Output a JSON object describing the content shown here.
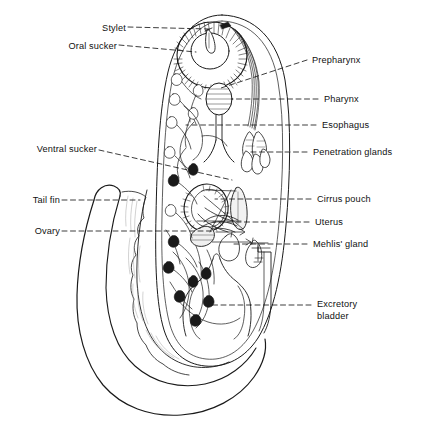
{
  "figure": {
    "background_color": "#ffffff",
    "line_color": "#1a1a1a",
    "leader_style": "dashed",
    "width": 422,
    "height": 425
  },
  "labels": {
    "left": [
      {
        "id": "stylet",
        "text": "Stylet",
        "x": 93,
        "y": 23,
        "leader_to_x": 207,
        "leader_to_y": 29,
        "slope": "down"
      },
      {
        "id": "oral_sucker",
        "text": "Oral sucker",
        "x": 55,
        "y": 41,
        "leader_to_x": 196,
        "leader_to_y": 50,
        "slope": "down"
      },
      {
        "id": "ventral_sucker",
        "text": "Ventral sucker",
        "x": 14,
        "y": 144,
        "leader_to_x": 224,
        "leader_to_y": 180,
        "slope": "down"
      },
      {
        "id": "tail_fin",
        "text": "Tail fin",
        "x": 26,
        "y": 196,
        "leader_to_x": 120,
        "leader_to_y": 200,
        "slope": "flat"
      },
      {
        "id": "ovary",
        "text": "Ovary",
        "x": 30,
        "y": 226,
        "leader_to_x": 200,
        "leader_to_y": 231,
        "slope": "flat"
      }
    ],
    "right": [
      {
        "id": "prepharynx",
        "text": "Prepharynx",
        "x": 312,
        "y": 56,
        "leader_to_x": 218,
        "leader_to_y": 84,
        "slope": "down"
      },
      {
        "id": "pharynx",
        "text": "Pharynx",
        "x": 325,
        "y": 95,
        "leader_to_x": 244,
        "leader_to_y": 98,
        "slope": "flat"
      },
      {
        "id": "esophagus",
        "text": "Esophagus",
        "x": 323,
        "y": 121,
        "leader_to_x": 215,
        "leader_to_y": 124,
        "slope": "flat"
      },
      {
        "id": "penetration_glands",
        "text": "Penetration glands",
        "x": 314,
        "y": 148,
        "leader_to_x": 248,
        "leader_to_y": 151,
        "slope": "flat"
      },
      {
        "id": "cirrus_pouch",
        "text": "Cirrus pouch",
        "x": 318,
        "y": 195,
        "leader_to_x": 215,
        "leader_to_y": 198,
        "slope": "flat"
      },
      {
        "id": "uterus",
        "text": "Uterus",
        "x": 316,
        "y": 218,
        "leader_to_x": 213,
        "leader_to_y": 221,
        "slope": "flat"
      },
      {
        "id": "mehlis_gland",
        "text": "Mehlis' gland",
        "x": 314,
        "y": 240,
        "leader_to_x": 230,
        "leader_to_y": 243,
        "slope": "flat"
      },
      {
        "id": "excretory_bladder",
        "text": "Excretory",
        "text2": "bladder",
        "x": 318,
        "y": 300,
        "leader_to_x": 213,
        "leader_to_y": 305,
        "slope": "flat"
      }
    ]
  },
  "anatomy": {
    "parts": [
      "body-outline",
      "oral-sucker",
      "stylet",
      "prepharynx",
      "pharynx",
      "esophagus",
      "penetration-glands",
      "ventral-sucker",
      "cirrus-pouch",
      "uterus",
      "ovary",
      "mehlis-gland",
      "excretory-bladder",
      "tail",
      "tail-fin",
      "cystogenous-gland-cells"
    ]
  }
}
